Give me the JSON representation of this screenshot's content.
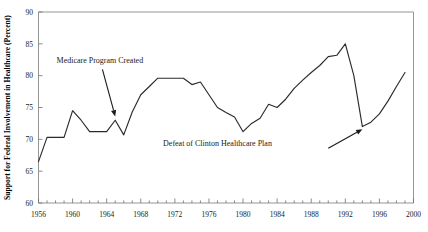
{
  "chart_data": {
    "type": "line",
    "title": "",
    "xlabel": "",
    "ylabel": "Support for Federal Involvement in Healthcare (Percent)",
    "xlim": [
      1956,
      2000
    ],
    "ylim": [
      60,
      90
    ],
    "grid": false,
    "legend": null,
    "y_ticks": [
      60,
      65,
      70,
      75,
      80,
      85,
      90
    ],
    "y_tick_labels": [
      "60",
      "65",
      "70",
      "75",
      "80",
      "85",
      "90"
    ],
    "x_ticks": [
      1956,
      1960,
      1964,
      1968,
      1972,
      1976,
      1980,
      1984,
      1988,
      1992,
      1996,
      2000
    ],
    "x_tick_labels": [
      "1956",
      "1960",
      "1964",
      "1968",
      "1972",
      "1976",
      "1980",
      "1984",
      "1988",
      "1992",
      "1996",
      "2000"
    ],
    "x_minor_tick_step": 1,
    "series": [
      {
        "name": "Support for Federal Involvement in Healthcare",
        "color": "#2b2b2b",
        "x": [
          1956,
          1957,
          1958,
          1959,
          1960,
          1961,
          1962,
          1963,
          1964,
          1965,
          1966,
          1967,
          1968,
          1969,
          1970,
          1971,
          1972,
          1973,
          1974,
          1975,
          1976,
          1977,
          1978,
          1979,
          1980,
          1981,
          1982,
          1983,
          1984,
          1985,
          1986,
          1987,
          1988,
          1989,
          1990,
          1991,
          1992,
          1993,
          1994,
          1995,
          1996,
          1997,
          1998,
          1999
        ],
        "y": [
          66.5,
          70.3,
          70.3,
          70.3,
          74.5,
          73.0,
          71.2,
          71.2,
          71.2,
          73.0,
          70.7,
          74.3,
          77.0,
          78.3,
          79.6,
          79.6,
          79.6,
          79.6,
          78.6,
          79.0,
          77.0,
          75.0,
          74.2,
          73.5,
          71.2,
          72.5,
          73.3,
          75.5,
          75.0,
          76.3,
          78.0,
          79.3,
          80.5,
          81.6,
          83.0,
          83.2,
          85.0,
          80.0,
          72.0,
          72.7,
          74.0,
          76.0,
          78.3,
          80.5
        ]
      }
    ],
    "annotations": [
      {
        "id": "medicare",
        "text": "Medicare Program Created",
        "text_x": 1963.2,
        "text_y": 82.0,
        "arrow_from_x": 1963.5,
        "arrow_from_y": 81.0,
        "arrow_to_x": 1965.0,
        "arrow_to_y": 73.6
      },
      {
        "id": "clinton",
        "text": "Defeat of Clinton Healthcare Plan",
        "text_x": 1977.0,
        "text_y": 69.0,
        "arrow_from_x": 1990.0,
        "arrow_from_y": 68.6,
        "arrow_to_x": 1994.0,
        "arrow_to_y": 71.6
      }
    ]
  }
}
